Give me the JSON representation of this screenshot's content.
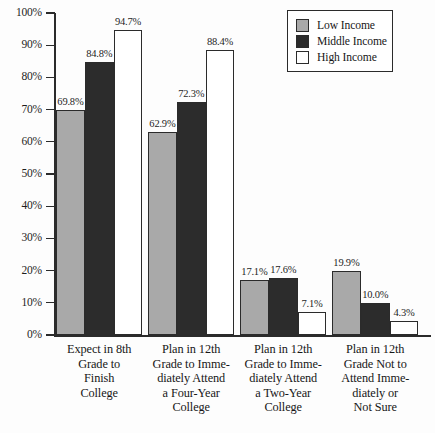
{
  "chart_data": {
    "type": "bar",
    "title": "",
    "subtitle": "",
    "xlabel": "",
    "ylabel": "",
    "ylim": [
      0,
      100
    ],
    "grid": false,
    "legend_position": "top-right",
    "categories": [
      "Expect in 8th Grade to Finish College",
      "Plan in 12th Grade to Immediately Attend a Four-Year College",
      "Plan in 12th Grade to Immediately Attend a Two-Year College",
      "Plan in 12th Grade Not to Attend Immediately or Not Sure"
    ],
    "category_lines": [
      [
        "Expect in 8th",
        "Grade to",
        "Finish",
        "College"
      ],
      [
        "Plan in 12th",
        "Grade to Imme-",
        "diately Attend",
        "a Four-Year",
        "College"
      ],
      [
        "Plan in 12th",
        "Grade to Imme-",
        "diately Attend",
        "a Two-Year",
        "College"
      ],
      [
        "Plan in 12th",
        "Grade Not to",
        "Attend Imme-",
        "diately or",
        "Not Sure"
      ]
    ],
    "series": [
      {
        "name": "Low Income",
        "color": "#a9a9a9",
        "values": [
          69.8,
          62.9,
          17.1,
          19.9
        ]
      },
      {
        "name": "Middle Income",
        "color": "#2c2c2c",
        "values": [
          84.8,
          72.3,
          17.6,
          10.0
        ]
      },
      {
        "name": "High Income",
        "color": "#ffffff",
        "values": [
          94.7,
          88.4,
          7.1,
          4.3
        ]
      }
    ],
    "value_labels": [
      [
        "69.8%",
        "84.8%",
        "94.7%"
      ],
      [
        "62.9%",
        "72.3%",
        "88.4%"
      ],
      [
        "17.1%",
        "17.6%",
        "7.1%"
      ],
      [
        "19.9%",
        "10.0%",
        "4.3%"
      ]
    ],
    "y_ticks": [
      0,
      10,
      20,
      30,
      40,
      50,
      60,
      70,
      80,
      90,
      100
    ],
    "y_tick_labels": [
      "0%",
      "10%",
      "20%",
      "30%",
      "40%",
      "50%",
      "60%",
      "70%",
      "80%",
      "90%",
      "100%"
    ]
  },
  "legend": {
    "items": [
      {
        "label": "Low Income",
        "swatch": "low"
      },
      {
        "label": "Middle Income",
        "swatch": "middle"
      },
      {
        "label": "High Income",
        "swatch": "high"
      }
    ]
  }
}
